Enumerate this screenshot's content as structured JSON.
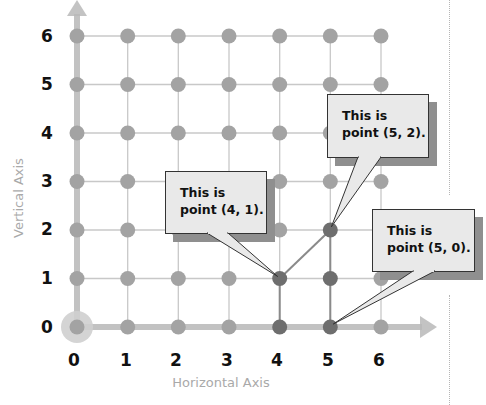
{
  "diagram": {
    "type": "coordinate-grid",
    "x_axis": {
      "title": "Horizontal Axis",
      "ticks": [
        "0",
        "1",
        "2",
        "3",
        "4",
        "5",
        "6"
      ]
    },
    "y_axis": {
      "title": "Vertical Axis",
      "ticks": [
        "0",
        "1",
        "2",
        "3",
        "4",
        "5",
        "6"
      ]
    },
    "origin_highlight": [
      0,
      0
    ],
    "highlighted_points": [
      [
        4,
        0
      ],
      [
        4,
        1
      ],
      [
        5,
        0
      ],
      [
        5,
        1
      ],
      [
        5,
        2
      ]
    ],
    "highlighted_paths": [
      [
        [
          4,
          0
        ],
        [
          4,
          1
        ]
      ],
      [
        [
          4,
          1
        ],
        [
          5,
          2
        ]
      ],
      [
        [
          5,
          0
        ],
        [
          5,
          2
        ]
      ]
    ],
    "callouts": [
      {
        "point": [
          4,
          1
        ],
        "line1": "This is",
        "line2": "point (4, 1)."
      },
      {
        "point": [
          5,
          2
        ],
        "line1": "This is",
        "line2": "point (5, 2)."
      },
      {
        "point": [
          5,
          0
        ],
        "line1": "This is",
        "line2": "point (5, 0)."
      }
    ]
  },
  "colors": {
    "grid_line": "#c8c8c8",
    "axis": "#b8b8b8",
    "dot": "#a3a3a3",
    "dot_highlight": "#6e6e6e",
    "path_highlight": "#8a8a8a",
    "callout_fill": "#e9e9e9",
    "callout_shadow": "#8f8f8f",
    "axis_title": "#a9a9a9"
  }
}
